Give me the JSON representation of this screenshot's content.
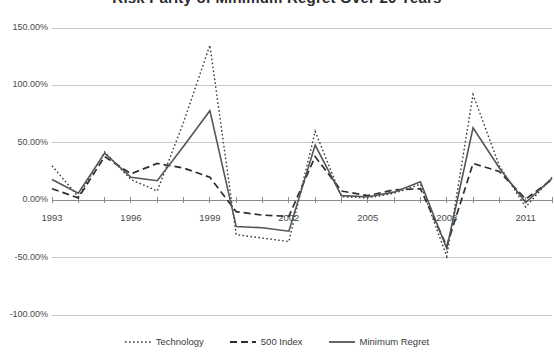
{
  "chart_data": {
    "type": "line",
    "title": "Risk Parity of Minimum Regret Over 20 Years",
    "xlabel": "",
    "ylabel": "",
    "grid": true,
    "legend_position": "bottom",
    "ylim": [
      -100,
      150
    ],
    "yticks": [
      150,
      100,
      50,
      0,
      -50,
      -100
    ],
    "ytick_labels": [
      "150.00%",
      "100.00%",
      "50.00%",
      "0.00%",
      "-50.00%",
      "-100.00%"
    ],
    "xlim": [
      1993,
      2012
    ],
    "xticks": [
      1993,
      1996,
      1999,
      2002,
      2005,
      2008,
      2011
    ],
    "xtick_labels": [
      "1993",
      "1996",
      "1999",
      "2002",
      "2005",
      "2008",
      "2011"
    ],
    "x": [
      1993,
      1994,
      1995,
      1996,
      1997,
      1998,
      1999,
      2000,
      2001,
      2002,
      2003,
      2004,
      2005,
      2006,
      2007,
      2008,
      2009,
      2010,
      2011,
      2012
    ],
    "series": [
      {
        "name": "Technology",
        "style": "dotted",
        "color": "#3a3a3a",
        "values": [
          30,
          3,
          42,
          18,
          8,
          68,
          135,
          -30,
          -33,
          -36,
          60,
          3,
          2,
          6,
          14,
          -49,
          92,
          30,
          -6,
          20
        ]
      },
      {
        "name": "500 Index",
        "style": "dashed",
        "color": "#2e2e2e",
        "values": [
          10,
          2,
          38,
          23,
          32,
          28,
          20,
          -10,
          -13,
          -14,
          38,
          8,
          4,
          9,
          10,
          -40,
          32,
          25,
          1,
          18
        ]
      },
      {
        "name": "Minimum Regret",
        "style": "solid",
        "color": "#555555",
        "values": [
          18,
          6,
          41,
          20,
          17,
          47,
          78,
          -23,
          -24,
          -27,
          48,
          4,
          3,
          7,
          16,
          -42,
          63,
          28,
          -2,
          19
        ]
      }
    ]
  },
  "legend": {
    "items": [
      {
        "label": "Technology",
        "style": "dotted"
      },
      {
        "label": "500 Index",
        "style": "dashed"
      },
      {
        "label": "Minimum Regret",
        "style": "solid"
      }
    ]
  }
}
